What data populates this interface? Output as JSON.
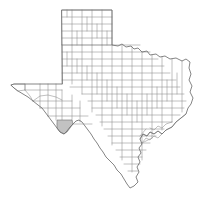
{
  "figure": {
    "kind": "choropleth-locator-map",
    "subject_state": "Texas",
    "width_px": 214,
    "height_px": 197
  },
  "style": {
    "background_color": "#ffffff",
    "county_fill": "#ffffff",
    "county_border_color": "#8c8c8c",
    "state_border_color": "#6f6f6f",
    "highlight_fill": "#c2c2c2",
    "highlight_border_color": "#6e6e6e"
  },
  "highlight": {
    "count": 1,
    "region_label": "Big Bend / far west Texas",
    "center_x_px": 66,
    "center_y_px": 127,
    "fill": "#c2c2c2"
  },
  "map_regions": [
    {
      "name": "panhandle",
      "note": "rectangular grid of counties, north"
    },
    {
      "name": "west-tip",
      "note": "El Paso point, far west"
    },
    {
      "name": "big-bend",
      "note": "southwest bulge containing the shaded county"
    },
    {
      "name": "north-border",
      "note": "Red River, irregular"
    },
    {
      "name": "east-border",
      "note": "Sabine River, irregular"
    },
    {
      "name": "gulf-coast",
      "note": "southeast jagged coastline with bays"
    },
    {
      "name": "south-border",
      "note": "Rio Grande to southern tip"
    }
  ],
  "labels": {
    "visible_text": []
  }
}
